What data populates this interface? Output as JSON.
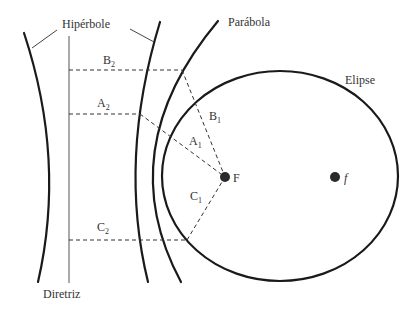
{
  "diagram": {
    "labels": {
      "hyperbola": "Hipérbole",
      "parabola": "Parábola",
      "ellipse": "Elipse",
      "directrix": "Diretriz",
      "focus_main": "F",
      "focus_second": "f"
    },
    "segments": {
      "A1": {
        "letter": "A",
        "sub": "1"
      },
      "A2": {
        "letter": "A",
        "sub": "2"
      },
      "B1": {
        "letter": "B",
        "sub": "1"
      },
      "B2": {
        "letter": "B",
        "sub": "2"
      },
      "C1": {
        "letter": "C",
        "sub": "1"
      },
      "C2": {
        "letter": "C",
        "sub": "2"
      }
    },
    "colors": {
      "stroke": "#1a1a1a",
      "text": "#333333",
      "background": "#ffffff"
    }
  }
}
